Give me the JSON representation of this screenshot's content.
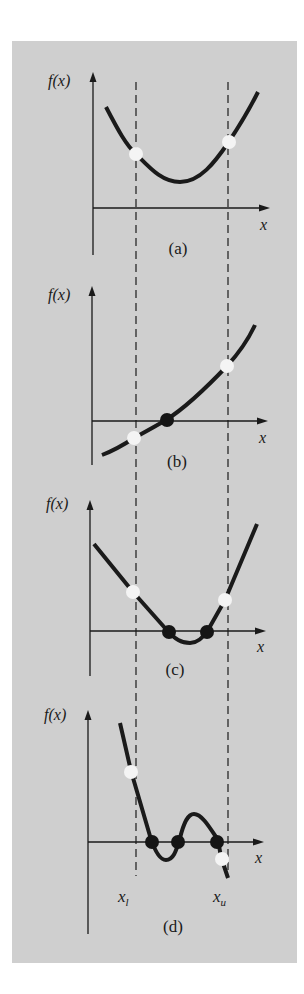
{
  "figure": {
    "panel_bg": "#cfcfcf",
    "curve_color": "#1a1a1a",
    "root_dot_color": "#151515",
    "bound_dot_color": "#f4f4f4",
    "bounds": {
      "lower_label": "x",
      "lower_sub": "l",
      "upper_label": "x",
      "upper_sub": "u"
    },
    "panels": [
      {
        "id": "a",
        "ylabel": "f(x)",
        "xlabel": "x",
        "caption": "(a)",
        "description": "No root within bounds; function same sign at both ends",
        "bound_dots": 2,
        "root_dots": 0
      },
      {
        "id": "b",
        "ylabel": "f(x)",
        "xlabel": "x",
        "caption": "(b)",
        "description": "Single root; function changes sign between bounds",
        "bound_dots": 2,
        "root_dots": 1
      },
      {
        "id": "c",
        "ylabel": "f(x)",
        "xlabel": "x",
        "caption": "(c)",
        "description": "Two roots; function same sign at both ends",
        "bound_dots": 2,
        "root_dots": 2
      },
      {
        "id": "d",
        "ylabel": "f(x)",
        "xlabel": "x",
        "caption": "(d)",
        "description": "Three roots; function changes sign between bounds",
        "bound_dots": 2,
        "root_dots": 3
      }
    ]
  }
}
